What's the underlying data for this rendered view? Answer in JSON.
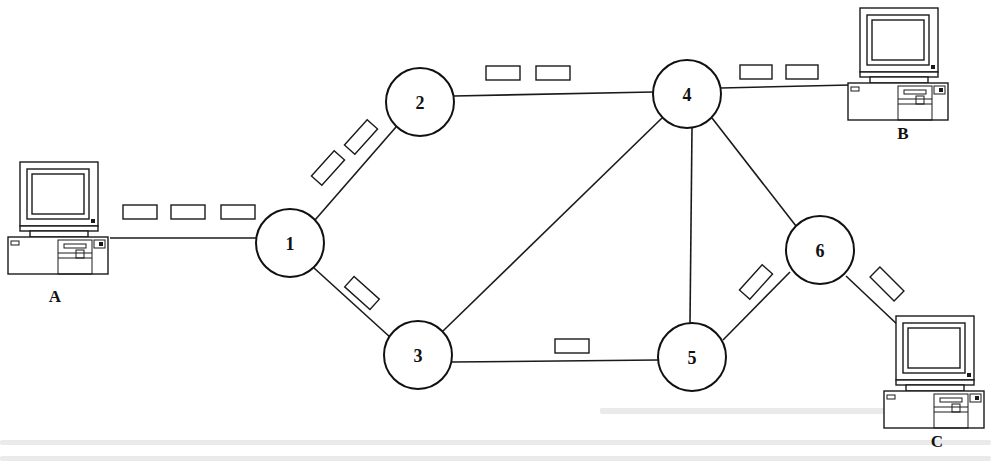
{
  "diagram": {
    "type": "packet-switched network",
    "colors": {
      "stroke": "#111111",
      "background": "#ffffff",
      "bleed_through": "#d9d9d9"
    },
    "nodes": [
      {
        "id": "1",
        "label": "1",
        "cx": 290,
        "cy": 243,
        "r": 34
      },
      {
        "id": "2",
        "label": "2",
        "cx": 420,
        "cy": 102,
        "r": 34
      },
      {
        "id": "3",
        "label": "3",
        "cx": 418,
        "cy": 355,
        "r": 34
      },
      {
        "id": "4",
        "label": "4",
        "cx": 687,
        "cy": 94,
        "r": 34
      },
      {
        "id": "5",
        "label": "5",
        "cx": 692,
        "cy": 357,
        "r": 34
      },
      {
        "id": "6",
        "label": "6",
        "cx": 820,
        "cy": 250,
        "r": 34
      }
    ],
    "hosts": [
      {
        "id": "A",
        "label": "A",
        "x": 8,
        "y": 162,
        "label_x": 55,
        "label_y": 302
      },
      {
        "id": "B",
        "label": "B",
        "x": 848,
        "y": 8,
        "label_x": 903,
        "label_y": 139
      },
      {
        "id": "C",
        "label": "C",
        "x": 884,
        "y": 316,
        "label_x": 937,
        "label_y": 447
      }
    ],
    "links": [
      {
        "from": "A",
        "to": "1",
        "x1": 110,
        "y1": 238,
        "x2": 256,
        "y2": 238
      },
      {
        "from": "1",
        "to": "2",
        "x1": 315,
        "y1": 220,
        "x2": 396,
        "y2": 127
      },
      {
        "from": "1",
        "to": "3",
        "x1": 314,
        "y1": 268,
        "x2": 391,
        "y2": 338
      },
      {
        "from": "2",
        "to": "4",
        "x1": 454,
        "y1": 96,
        "x2": 653,
        "y2": 92
      },
      {
        "from": "3",
        "to": "4",
        "x1": 443,
        "y1": 331,
        "x2": 662,
        "y2": 118
      },
      {
        "from": "3",
        "to": "5",
        "x1": 452,
        "y1": 362,
        "x2": 658,
        "y2": 360
      },
      {
        "from": "4",
        "to": "5",
        "x1": 692,
        "y1": 128,
        "x2": 690,
        "y2": 323
      },
      {
        "from": "4",
        "to": "6",
        "x1": 712,
        "y1": 118,
        "x2": 796,
        "y2": 226
      },
      {
        "from": "4",
        "to": "B",
        "x1": 721,
        "y1": 88,
        "x2": 850,
        "y2": 85
      },
      {
        "from": "5",
        "to": "6",
        "x1": 723,
        "y1": 340,
        "x2": 790,
        "y2": 272
      },
      {
        "from": "6",
        "to": "C",
        "x1": 846,
        "y1": 276,
        "x2": 900,
        "y2": 327
      }
    ],
    "packets": [
      {
        "link": "A-1",
        "cx": 140,
        "cy": 212,
        "w": 34,
        "h": 14,
        "angle": 0
      },
      {
        "link": "A-1",
        "cx": 188,
        "cy": 212,
        "w": 34,
        "h": 14,
        "angle": 0
      },
      {
        "link": "A-1",
        "cx": 238,
        "cy": 212,
        "w": 34,
        "h": 14,
        "angle": 0
      },
      {
        "link": "1-2",
        "cx": 328,
        "cy": 168,
        "w": 34,
        "h": 14,
        "angle": -48
      },
      {
        "link": "1-2",
        "cx": 361,
        "cy": 137,
        "w": 34,
        "h": 14,
        "angle": -48
      },
      {
        "link": "1-3",
        "cx": 362,
        "cy": 293,
        "w": 34,
        "h": 14,
        "angle": 42
      },
      {
        "link": "2-4",
        "cx": 503,
        "cy": 73,
        "w": 34,
        "h": 14,
        "angle": 0
      },
      {
        "link": "2-4",
        "cx": 553,
        "cy": 73,
        "w": 34,
        "h": 14,
        "angle": 0
      },
      {
        "link": "4-B",
        "cx": 756,
        "cy": 72,
        "w": 32,
        "h": 14,
        "angle": 0
      },
      {
        "link": "4-B",
        "cx": 802,
        "cy": 72,
        "w": 32,
        "h": 14,
        "angle": 0
      },
      {
        "link": "3-5",
        "cx": 572,
        "cy": 346,
        "w": 34,
        "h": 14,
        "angle": 0
      },
      {
        "link": "5-6",
        "cx": 756,
        "cy": 282,
        "w": 34,
        "h": 14,
        "angle": -48
      },
      {
        "link": "6-C",
        "cx": 887,
        "cy": 284,
        "w": 34,
        "h": 14,
        "angle": 45
      }
    ]
  }
}
